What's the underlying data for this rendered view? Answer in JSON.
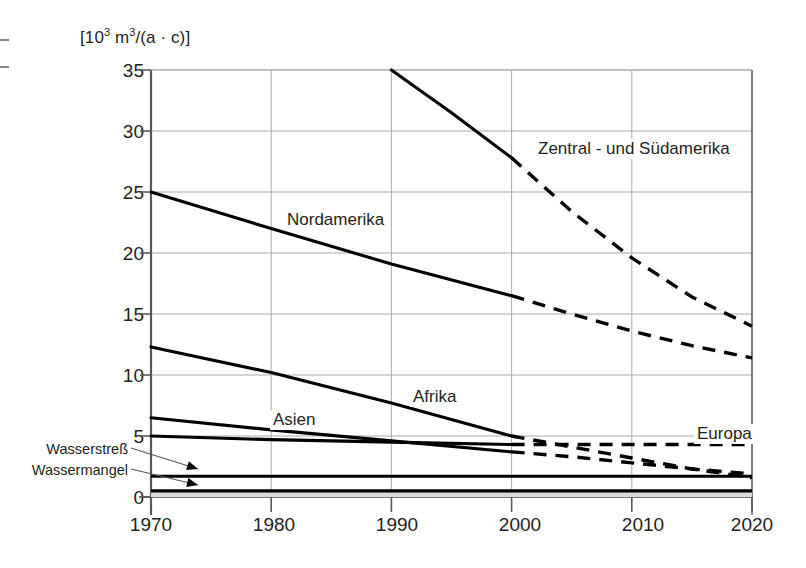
{
  "chart_data": {
    "type": "line",
    "title": "",
    "xlabel": "",
    "ylabel": "[10³ m³/(a · c)]",
    "ylabel_parts": {
      "prefix": "[10",
      "exp1": "3",
      "mid": " m",
      "exp2": "3",
      "suffix": "/(a · c)]"
    },
    "xlim": [
      1970,
      2020
    ],
    "ylim": [
      0,
      35
    ],
    "xticks": [
      "1970",
      "1980",
      "1990",
      "2000",
      "2010",
      "2020"
    ],
    "yticks": [
      "0",
      "5",
      "10",
      "15",
      "20",
      "25",
      "30",
      "35"
    ],
    "grid": true,
    "legend_position": "inline-labels",
    "note": "Solid segments are historical data (up to 2000); dashed segments are projections (2000-2020).",
    "series": [
      {
        "name": "Zentral - und Südamerika",
        "label": "Zentral - und Südamerika",
        "label_x": 1999.0,
        "label_y": 28.3,
        "x": [
          1990,
          1995,
          2000,
          2005,
          2010,
          2015,
          2020
        ],
        "values": [
          35.0,
          31.5,
          27.8,
          23.4,
          19.6,
          16.4,
          14.0
        ],
        "solid_until": 2000
      },
      {
        "name": "Nordamerika",
        "label": "Nordamerika",
        "label_x": 1983.0,
        "label_y": 21.9,
        "x": [
          1970,
          1980,
          1990,
          2000,
          2005,
          2010,
          2015,
          2020
        ],
        "values": [
          25.0,
          22.0,
          19.1,
          16.5,
          15.0,
          13.6,
          12.4,
          11.4
        ],
        "solid_until": 2000
      },
      {
        "name": "Afrika",
        "label": "Afrika",
        "label_x": 1992.5,
        "label_y": 10.2,
        "x": [
          1970,
          1980,
          1990,
          2000,
          2005,
          2010,
          2015,
          2020
        ],
        "values": [
          12.3,
          10.2,
          7.7,
          5.0,
          4.1,
          3.2,
          2.3,
          1.6
        ],
        "solid_until": 2000
      },
      {
        "name": "Asien",
        "label": "Asien",
        "label_x": 1980.3,
        "label_y": 6.5,
        "x": [
          1970,
          1980,
          1990,
          2000,
          2005,
          2010,
          2015,
          2020
        ],
        "values": [
          6.5,
          5.5,
          4.6,
          3.7,
          3.3,
          2.8,
          2.3,
          1.9
        ],
        "solid_until": 2000
      },
      {
        "name": "Europa",
        "label": "Europa",
        "label_x": 2014.2,
        "label_y": 5.2,
        "x": [
          1970,
          1980,
          1990,
          2000,
          2005,
          2010,
          2015,
          2020
        ],
        "values": [
          5.0,
          4.7,
          4.5,
          4.3,
          4.3,
          4.3,
          4.3,
          4.3
        ],
        "solid_until": 2000
      }
    ],
    "threshold_lines": [
      {
        "name": "Wasserstreß",
        "label": "Wasserstreß",
        "value": 1.7
      },
      {
        "name": "Wassermangel",
        "label": "Wassermangel",
        "value": 0.5
      }
    ]
  }
}
